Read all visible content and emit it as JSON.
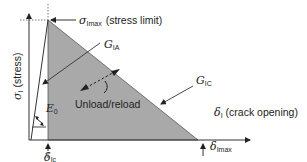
{
  "diagram": {
    "colors": {
      "shade": "#a9a9a9",
      "line": "#333333",
      "background": "#ffffff"
    },
    "axes": {
      "y_symbol": "σ",
      "y_subscript": "I",
      "y_text": "(stress)",
      "x_symbol": "δ",
      "x_subscript": "I",
      "x_text": "(crack opening)"
    },
    "labels": {
      "peak_symbol": "σ",
      "peak_subscript": "Imax",
      "peak_text": "(stress limit)",
      "g_ia_symbol": "G",
      "g_ia_subscript": "IA",
      "g_ic_symbol": "G",
      "g_ic_subscript": "IC",
      "e0_symbol": "E",
      "e0_subscript": "0",
      "unload": "Unload/reload",
      "delta_ic_symbol": "δ",
      "delta_ic_subscript": "Ic",
      "delta_imax_symbol": "δ",
      "delta_imax_subscript": "Imax"
    }
  }
}
